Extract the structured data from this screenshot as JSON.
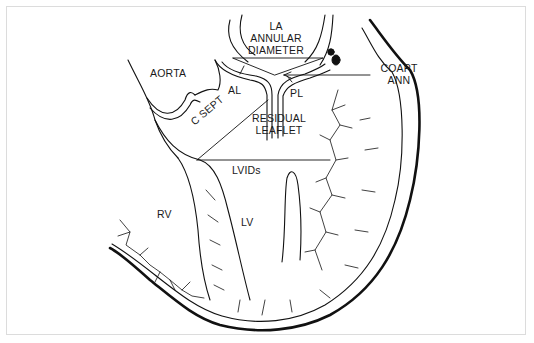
{
  "figure": {
    "type": "anatomical line diagram",
    "line_color": "#111111",
    "border_color": "#dcdcdc",
    "background": "#ffffff"
  },
  "labels": {
    "la_annular_diameter": [
      "LA",
      "ANNULAR",
      "DIAMETER"
    ],
    "aorta": "AORTA",
    "coapt_ann": [
      "COAPT",
      "ANN"
    ],
    "al": "AL",
    "pl": "PL",
    "c_sept": "C SEPT",
    "residual_leaflet": [
      "RESIDUAL",
      "LEAFLET"
    ],
    "lvids": "LVIDs",
    "rv": "RV",
    "lv": "LV"
  }
}
